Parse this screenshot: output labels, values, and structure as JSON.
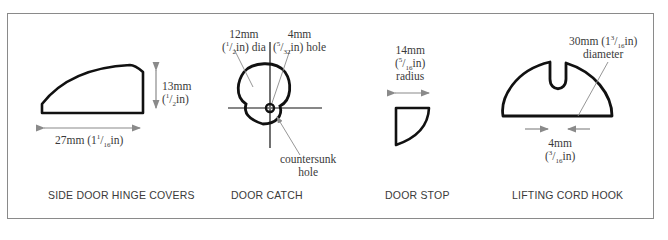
{
  "figure": {
    "panels": [
      {
        "id": "side-door-hinge-covers",
        "caption": "SIDE DOOR HINGE COVERS",
        "height_label": {
          "mm": "13mm",
          "in_prefix": "(",
          "in_num": "1",
          "in_den": "2",
          "in_suffix": "in)"
        },
        "width_label": {
          "mm": "27mm",
          "in_prefix": " (1",
          "in_num": "1",
          "in_den": "16",
          "in_suffix": "in)"
        }
      },
      {
        "id": "door-catch",
        "caption": "DOOR CATCH",
        "dia_label": {
          "mm": "12mm",
          "in_prefix": "(",
          "in_num": "1",
          "in_den": "2",
          "in_suffix": "in) dia"
        },
        "hole_label": {
          "mm": "4mm",
          "in_prefix": "(",
          "in_num": "5",
          "in_den": "32",
          "in_suffix": "in) hole"
        },
        "countersunk_label": {
          "line1": "countersunk",
          "line2": "hole"
        }
      },
      {
        "id": "door-stop",
        "caption": "DOOR STOP",
        "radius_label": {
          "mm": "14mm",
          "in_prefix": "(",
          "in_num": "5",
          "in_den": "16",
          "in_suffix": "in)",
          "line3": "radius"
        }
      },
      {
        "id": "lifting-cord-hook",
        "caption": "LIFTING CORD HOOK",
        "diameter_label": {
          "mm": "30mm",
          "in_prefix": " (1",
          "in_num": "3",
          "in_den": "16",
          "in_suffix": "in)",
          "line2": "diameter"
        },
        "slot_label": {
          "mm": "4mm",
          "in_prefix": "(",
          "in_num": "3",
          "in_den": "16",
          "in_suffix": "in)"
        }
      }
    ],
    "colors": {
      "outline": "#111111",
      "dimension": "#8a8a8a",
      "text": "#3a3a3a",
      "frame": "#8a8a8a"
    }
  }
}
